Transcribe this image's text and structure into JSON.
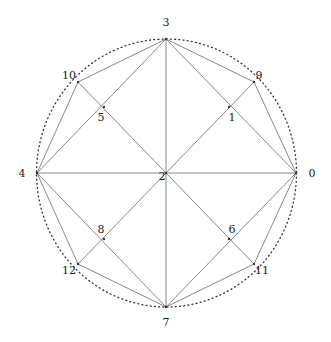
{
  "diagram": {
    "type": "graph-on-circle",
    "circle": {
      "cx": 166.5,
      "cy": 173,
      "rx": 130,
      "ry": 134,
      "style": "dotted",
      "color": "#333333"
    },
    "edge_color": "#888888",
    "nodes": [
      {
        "id": "0",
        "label": "0",
        "x": 296,
        "y": 173,
        "lx": 312,
        "ly": 177,
        "anchor": "middle"
      },
      {
        "id": "1",
        "label": "1",
        "x": 229,
        "y": 107,
        "lx": 232,
        "ly": 121,
        "anchor": "middle"
      },
      {
        "id": "2",
        "label": "2",
        "x": 166,
        "y": 173,
        "lx": 162,
        "ly": 180,
        "anchor": "middle"
      },
      {
        "id": "3",
        "label": "3",
        "x": 166,
        "y": 39,
        "lx": 166,
        "ly": 26,
        "anchor": "middle"
      },
      {
        "id": "4",
        "label": "4",
        "x": 37,
        "y": 173,
        "lx": 22,
        "ly": 177,
        "anchor": "middle"
      },
      {
        "id": "5",
        "label": "5",
        "x": 104,
        "y": 107,
        "lx": 101,
        "ly": 121,
        "anchor": "middle"
      },
      {
        "id": "6",
        "label": "6",
        "x": 229,
        "y": 239,
        "lx": 232,
        "ly": 233,
        "anchor": "middle"
      },
      {
        "id": "7",
        "label": "7",
        "x": 166,
        "y": 307,
        "lx": 166,
        "ly": 326,
        "anchor": "middle"
      },
      {
        "id": "8",
        "label": "8",
        "x": 104,
        "y": 239,
        "lx": 101,
        "ly": 233,
        "anchor": "middle"
      },
      {
        "id": "9",
        "label": "9",
        "x": 254,
        "y": 82,
        "lx": 259,
        "ly": 79,
        "anchor": "middle"
      },
      {
        "id": "10",
        "label": "10",
        "x": 78,
        "y": 82,
        "lx": 69,
        "ly": 79,
        "anchor": "middle"
      },
      {
        "id": "11",
        "label": "11",
        "x": 254,
        "y": 264,
        "lx": 262,
        "ly": 274,
        "anchor": "middle"
      },
      {
        "id": "12",
        "label": "12",
        "x": 78,
        "y": 264,
        "lx": 69,
        "ly": 274,
        "anchor": "middle"
      }
    ],
    "edges": [
      [
        "0",
        "9"
      ],
      [
        "9",
        "3"
      ],
      [
        "3",
        "10"
      ],
      [
        "10",
        "4"
      ],
      [
        "4",
        "12"
      ],
      [
        "12",
        "7"
      ],
      [
        "7",
        "11"
      ],
      [
        "11",
        "0"
      ],
      [
        "3",
        "4"
      ],
      [
        "4",
        "7"
      ],
      [
        "7",
        "0"
      ],
      [
        "0",
        "3"
      ],
      [
        "3",
        "7"
      ],
      [
        "4",
        "0"
      ],
      [
        "10",
        "11"
      ],
      [
        "9",
        "12"
      ]
    ]
  }
}
